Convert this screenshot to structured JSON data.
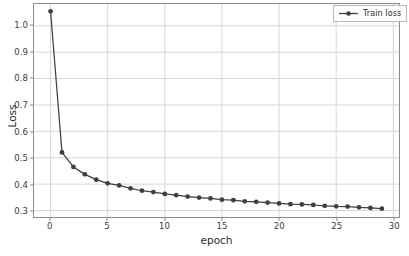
{
  "chart_data": {
    "type": "line",
    "title": "",
    "xlabel": "epoch",
    "ylabel": "Loss",
    "xlim": [
      -1.45,
      30.5
    ],
    "ylim": [
      0.2755,
      1.0825
    ],
    "xticks": [
      0,
      5,
      10,
      15,
      20,
      25,
      30
    ],
    "xtick_labels": [
      "0",
      "5",
      "10",
      "15",
      "20",
      "25",
      "30"
    ],
    "yticks": [
      0.3,
      0.4,
      0.5,
      0.6,
      0.7,
      0.8,
      0.9,
      1.0
    ],
    "ytick_labels": [
      "0.3",
      "0.4",
      "0.5",
      "0.6",
      "0.7",
      "0.8",
      "0.9",
      "1.0"
    ],
    "grid": true,
    "grid_color": "#d6d6d6",
    "legend_position": "upper right",
    "series": [
      {
        "name": "Train loss",
        "color": "#3f3f3f",
        "marker": "circle",
        "x": [
          0,
          1,
          2,
          3,
          4,
          5,
          6,
          7,
          8,
          9,
          10,
          11,
          12,
          13,
          14,
          15,
          16,
          17,
          18,
          19,
          20,
          21,
          22,
          23,
          24,
          25,
          26,
          27,
          28,
          29
        ],
        "values": [
          1.055,
          0.52,
          0.465,
          0.437,
          0.417,
          0.403,
          0.395,
          0.384,
          0.375,
          0.37,
          0.363,
          0.358,
          0.353,
          0.349,
          0.346,
          0.341,
          0.339,
          0.335,
          0.333,
          0.33,
          0.327,
          0.324,
          0.323,
          0.321,
          0.318,
          0.316,
          0.315,
          0.312,
          0.31,
          0.307
        ]
      }
    ]
  },
  "legend": {
    "entries": [
      {
        "label": "Train loss"
      }
    ]
  },
  "axis": {
    "x_title": "epoch",
    "y_title": "Loss"
  }
}
